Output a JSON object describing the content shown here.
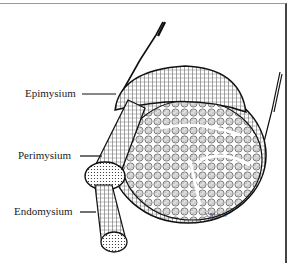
{
  "figure": {
    "type": "anatomical-illustration",
    "labels": [
      {
        "text": "Epimysium",
        "x": 25,
        "y": 90
      },
      {
        "text": "Perimysium",
        "x": 18,
        "y": 152
      },
      {
        "text": "Endomysium",
        "x": 14,
        "y": 207
      }
    ],
    "signature": "S.Nfos 97",
    "colors": {
      "ink": "#1a1a1a",
      "background": "#ffffff"
    }
  }
}
